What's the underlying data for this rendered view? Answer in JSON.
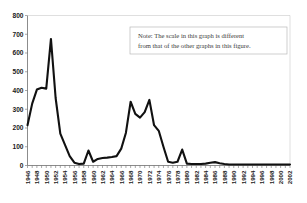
{
  "figure": {
    "background_color": "#ffffff",
    "line_color": "#111111",
    "axis_color": "#6f6f6f",
    "note_border_color": "#b9b9b9",
    "note_text_color": "#3b3b3b"
  },
  "note": {
    "line1": "Note: The scale in this graph is different",
    "line2": "from that of the other graphs in this figure."
  },
  "chart_data": {
    "type": "line",
    "title": "",
    "subtitle": "",
    "xlabel": "",
    "ylabel": "",
    "grid": false,
    "legend": false,
    "legend_position": "none",
    "xlim": [
      1946,
      2002
    ],
    "ylim": [
      0,
      800
    ],
    "ytick_labels": [
      "0",
      "100",
      "200",
      "300",
      "400",
      "500",
      "600",
      "700",
      "800"
    ],
    "ytick_values": [
      0,
      100,
      200,
      300,
      400,
      500,
      600,
      700,
      800
    ],
    "xtick_labels": [
      "1946",
      "1948",
      "1950",
      "1952",
      "1954",
      "1956",
      "1958",
      "1960",
      "1962",
      "1964",
      "1966",
      "1968",
      "1970",
      "1972",
      "1974",
      "1976",
      "1978",
      "1980",
      "1982",
      "1984",
      "1986",
      "1988",
      "1990",
      "1992",
      "1994",
      "1996",
      "1998",
      "2000",
      "2002"
    ],
    "xtick_values": [
      1946,
      1948,
      1950,
      1952,
      1954,
      1956,
      1958,
      1960,
      1962,
      1964,
      1966,
      1968,
      1970,
      1972,
      1974,
      1976,
      1978,
      1980,
      1982,
      1984,
      1986,
      1988,
      1990,
      1992,
      1994,
      1996,
      1998,
      2000,
      2002
    ],
    "x": [
      1946,
      1947,
      1948,
      1949,
      1950,
      1951,
      1952,
      1953,
      1954,
      1955,
      1956,
      1957,
      1958,
      1959,
      1960,
      1961,
      1962,
      1963,
      1964,
      1965,
      1966,
      1967,
      1968,
      1969,
      1970,
      1971,
      1972,
      1973,
      1974,
      1975,
      1976,
      1977,
      1978,
      1979,
      1980,
      1981,
      1982,
      1983,
      1984,
      1985,
      1986,
      1987,
      1988,
      1989,
      1990,
      1991,
      1992,
      1993,
      1994,
      1995,
      1996,
      1997,
      1998,
      1999,
      2000,
      2001,
      2002
    ],
    "values": [
      215,
      330,
      405,
      415,
      410,
      675,
      360,
      170,
      110,
      50,
      15,
      8,
      10,
      80,
      20,
      35,
      40,
      42,
      45,
      50,
      90,
      175,
      340,
      275,
      255,
      285,
      350,
      215,
      185,
      100,
      20,
      15,
      20,
      85,
      10,
      8,
      8,
      8,
      10,
      15,
      18,
      12,
      8,
      5,
      5,
      5,
      5,
      5,
      5,
      5,
      5,
      5,
      5,
      5,
      5,
      5,
      5
    ],
    "series": [
      {
        "name": "series-1",
        "color": "#111111",
        "values": [
          215,
          330,
          405,
          415,
          410,
          675,
          360,
          170,
          110,
          50,
          15,
          8,
          10,
          80,
          20,
          35,
          40,
          42,
          45,
          50,
          90,
          175,
          340,
          275,
          255,
          285,
          350,
          215,
          185,
          100,
          20,
          15,
          20,
          85,
          10,
          8,
          8,
          8,
          10,
          15,
          18,
          12,
          8,
          5,
          5,
          5,
          5,
          5,
          5,
          5,
          5,
          5,
          5,
          5,
          5,
          5,
          5
        ]
      }
    ],
    "annotations": [
      {
        "name": "scale-note",
        "text": "Note: The scale in this graph is different from that of the other graphs in this figure."
      }
    ]
  }
}
